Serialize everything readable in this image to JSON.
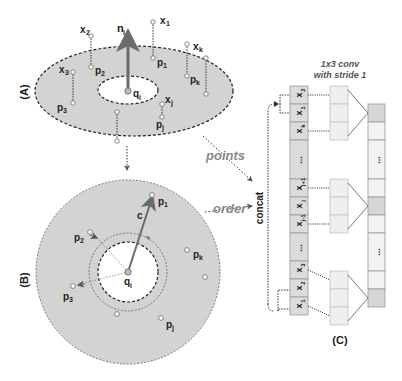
{
  "panels": {
    "A": {
      "label": "(A)",
      "points_label": [
        "x1",
        "x2",
        "x3",
        "xk",
        "xj",
        "p1",
        "p2",
        "p3",
        "pk",
        "pj"
      ],
      "normal_label": "n",
      "normal_sub": "i",
      "center_label": "q",
      "center_sub": "i"
    },
    "B": {
      "label": "(B)",
      "center_label": "q",
      "center_sub": "i",
      "vector_label": "c"
    },
    "C": {
      "label": "(C)",
      "title_line1": "1x3 conv",
      "title_line2": "with stride 1",
      "concat_label": "concat",
      "cells": [
        "x2",
        "x1",
        "xk",
        "...",
        "xj+1",
        "xj",
        "xj-1",
        "...",
        "x3",
        "x2",
        "x1"
      ]
    }
  },
  "labels": {
    "x1": {
      "base": "x",
      "sub": "1"
    },
    "x2": {
      "base": "x",
      "sub": "2"
    },
    "x3": {
      "base": "x",
      "sub": "3"
    },
    "xk": {
      "base": "x",
      "sub": "k"
    },
    "xj": {
      "base": "x",
      "sub": "j"
    },
    "p1": {
      "base": "p",
      "sub": "1"
    },
    "p2": {
      "base": "p",
      "sub": "2"
    },
    "p3": {
      "base": "p",
      "sub": "3"
    },
    "pk": {
      "base": "p",
      "sub": "k"
    },
    "pj": {
      "base": "p",
      "sub": "j"
    },
    "xjp1": {
      "base": "x",
      "sub": "j+1"
    },
    "xjm1": {
      "base": "x",
      "sub": "j-1"
    },
    "dots": "..."
  },
  "arrows": {
    "points": "points",
    "order": "order"
  },
  "colors": {
    "ring": "#d3d3d3",
    "arrow": "#6b6b6b",
    "cell": "#dcdcdc",
    "cell_light": "#efefef",
    "cell_dark": "#d6d6d6",
    "text_gray": "#8a8a8a"
  }
}
